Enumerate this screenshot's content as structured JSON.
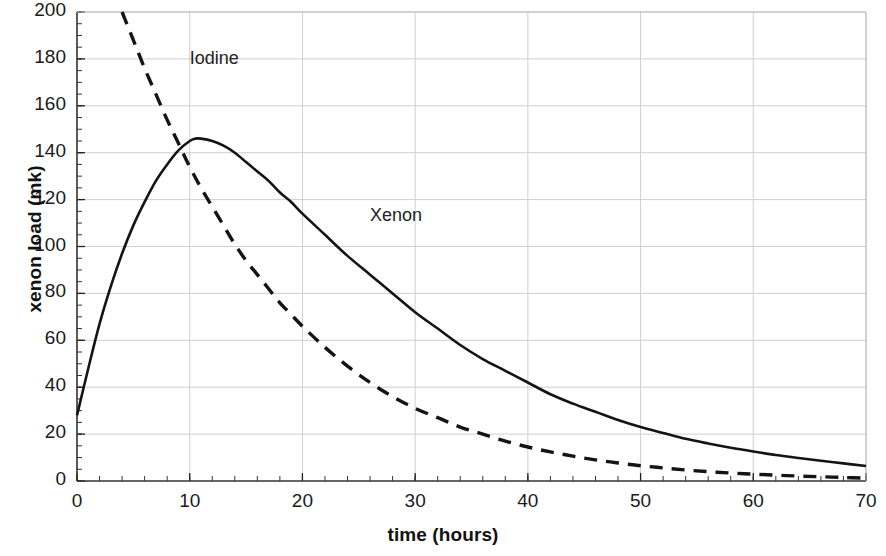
{
  "chart_data": {
    "type": "line",
    "title": "",
    "xlabel": "time (hours)",
    "ylabel": "xenon load (mk)",
    "xlim": [
      0,
      70
    ],
    "ylim": [
      0,
      200
    ],
    "xticks": [
      0,
      10,
      20,
      30,
      40,
      50,
      60,
      70
    ],
    "yticks": [
      0,
      20,
      40,
      60,
      80,
      100,
      120,
      140,
      160,
      180,
      200
    ],
    "x_minor_tick_step": 2,
    "y_minor_tick_step": 5,
    "grid": true,
    "grid_color": "#cfcfcf",
    "legend_position": "inline-annotations",
    "annotations": [
      {
        "text": "Iodine",
        "x": 10.0,
        "y": 180
      },
      {
        "text": "Xenon",
        "x": 26.0,
        "y": 113
      }
    ],
    "series": [
      {
        "name": "Xenon",
        "style": "solid",
        "color": "#141414",
        "x": [
          0,
          1,
          2,
          3,
          4,
          5,
          6,
          7,
          8,
          9,
          10,
          10.5,
          11,
          12,
          13,
          14,
          15,
          16,
          17,
          18,
          19,
          20,
          22,
          24,
          26,
          28,
          30,
          32,
          34,
          36,
          38,
          40,
          42,
          44,
          46,
          48,
          50,
          52,
          54,
          56,
          58,
          60,
          62,
          64,
          66,
          68,
          70
        ],
        "y": [
          28,
          48,
          67,
          83,
          97,
          109,
          119,
          128,
          135,
          141,
          145,
          146,
          146,
          145,
          143,
          140,
          136,
          132,
          128,
          123,
          119,
          114,
          105,
          96,
          88,
          80,
          72,
          65,
          58,
          52,
          47,
          42,
          37,
          33,
          29.5,
          26,
          23,
          20.5,
          18,
          16,
          14.2,
          12.6,
          11.1,
          9.8,
          8.6,
          7.5,
          6.4
        ]
      },
      {
        "name": "Iodine",
        "style": "dashed",
        "color": "#141414",
        "x": [
          4,
          5,
          6,
          7,
          8,
          9,
          10,
          11,
          12,
          13,
          14,
          15,
          16,
          17,
          18,
          19,
          20,
          22,
          24,
          26,
          28,
          30,
          32,
          34,
          36,
          38,
          40,
          42,
          44,
          46,
          48,
          50,
          52,
          54,
          56,
          58,
          60,
          62,
          64,
          66,
          68,
          70
        ],
        "y": [
          200,
          188,
          176,
          165,
          154,
          144,
          134,
          125,
          117,
          109,
          101,
          94,
          88,
          82,
          76,
          71,
          66,
          57,
          49,
          42,
          36,
          31,
          27,
          23,
          20,
          17,
          14.5,
          12.4,
          10.6,
          9.0,
          7.7,
          6.5,
          5.6,
          4.7,
          4.0,
          3.4,
          2.9,
          2.5,
          2.1,
          1.8,
          1.5,
          1.2
        ]
      }
    ]
  }
}
